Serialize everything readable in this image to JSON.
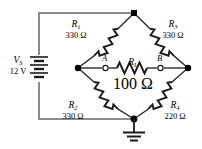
{
  "diagram": {
    "type": "wheatstone-bridge-circuit",
    "colors": {
      "wire_outer": "#8c8c8c",
      "wire_bridge": "#1a1a1a",
      "node_fill": "#000000",
      "terminal_fill": "#ffffff",
      "text": "#000000",
      "background": "#ffffff"
    },
    "source": {
      "symbol": "V",
      "subscript": "S",
      "value": "12 V",
      "component": "battery-multicell"
    },
    "resistors": [
      {
        "symbol": "R",
        "subscript": "1",
        "value": "330 Ω",
        "position": "upper-left"
      },
      {
        "symbol": "R",
        "subscript": "3",
        "value": "330 Ω",
        "position": "upper-right"
      },
      {
        "symbol": "R",
        "subscript": "L",
        "value": "100 Ω",
        "position": "bridge-center"
      },
      {
        "symbol": "R",
        "subscript": "2",
        "value": "330 Ω",
        "position": "lower-left"
      },
      {
        "symbol": "R",
        "subscript": "4",
        "value": "220 Ω",
        "position": "lower-right"
      }
    ],
    "terminals": [
      {
        "label": "A",
        "position": "bridge-left"
      },
      {
        "label": "B",
        "position": "bridge-right"
      }
    ],
    "ground": {
      "symbol": "earth-ground",
      "position": "bottom-node"
    }
  }
}
